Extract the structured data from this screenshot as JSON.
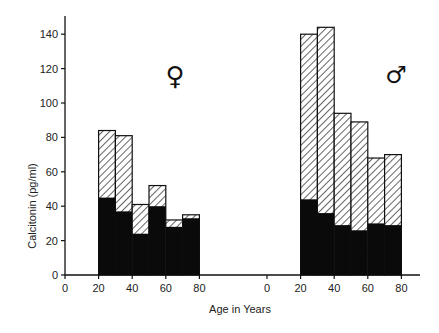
{
  "chart_data": {
    "type": "bar",
    "title": "",
    "xlabel": "Age in Years",
    "ylabel": "Calcitonin (pg/ml)",
    "ylim": [
      0,
      150
    ],
    "yticks": [
      0,
      20,
      40,
      60,
      80,
      100,
      120,
      140
    ],
    "xticks": [
      0,
      20,
      40,
      60,
      80
    ],
    "bin_edges": [
      20,
      30,
      40,
      50,
      60,
      70,
      80
    ],
    "legend": {
      "hatched": "total",
      "solid": "lower component"
    },
    "panels": [
      {
        "name": "female",
        "symbol": "♀",
        "categories": [
          "20-30",
          "30-40",
          "40-50",
          "50-60",
          "60-70",
          "70-80"
        ],
        "series": [
          {
            "name": "total (hatched top)",
            "values": [
              84,
              81,
              41,
              52,
              32,
              35
            ]
          },
          {
            "name": "solid (black)",
            "values": [
              45,
              37,
              24,
              40,
              28,
              33
            ]
          }
        ]
      },
      {
        "name": "male",
        "symbol": "♂",
        "categories": [
          "20-30",
          "30-40",
          "40-50",
          "50-60",
          "60-70",
          "70-80"
        ],
        "series": [
          {
            "name": "total (hatched top)",
            "values": [
              140,
              144,
              94,
              89,
              68,
              70
            ]
          },
          {
            "name": "solid (black)",
            "values": [
              44,
              36,
              29,
              26,
              30,
              29
            ]
          }
        ]
      }
    ]
  }
}
